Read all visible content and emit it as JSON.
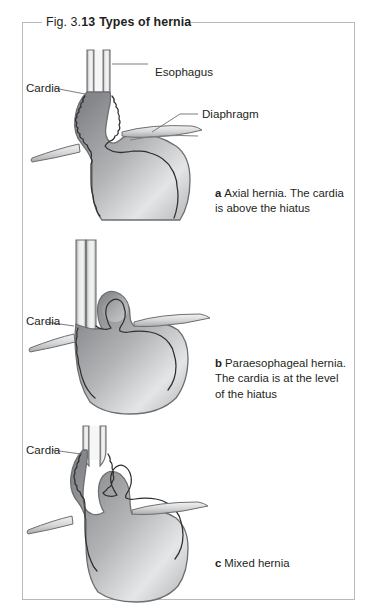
{
  "figure": {
    "title_prefix": "Fig. 3.",
    "title_number": "13",
    "title_name": "Types of hernia"
  },
  "panels": [
    {
      "id": "a",
      "marker": "a",
      "caption": "Axial hernia. The cardia is above the hiatus",
      "labels": [
        {
          "name": "cardia",
          "text": "Cardia"
        },
        {
          "name": "esophagus",
          "text": "Esophagus"
        },
        {
          "name": "diaphragm",
          "text": "Diaphragm"
        }
      ]
    },
    {
      "id": "b",
      "marker": "b",
      "caption": "Paraesophageal hernia. The cardia is at the level of the hiatus",
      "labels": [
        {
          "name": "cardia",
          "text": "Cardia"
        }
      ]
    },
    {
      "id": "c",
      "marker": "c",
      "caption": "Mixed hernia",
      "labels": [
        {
          "name": "cardia",
          "text": "Cardia"
        }
      ]
    }
  ],
  "colors": {
    "frame": "#b9b9b9",
    "text": "#231f20",
    "organ_outline": "#6d6e71",
    "organ_fill_light": "#e8e8e8",
    "organ_fill_dark": "#8c8d8f",
    "mucosa_line": "#3a3a3a",
    "leader_line": "#6d6e71"
  }
}
